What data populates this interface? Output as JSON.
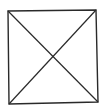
{
  "diagram": {
    "label": "Square with crossed diagonals",
    "stroke_color": "#2a2a2a",
    "background_color": "#ffffff",
    "shape": {
      "type": "square",
      "corners": {
        "top_left": [
          8,
          11
        ],
        "top_right": [
          96,
          10
        ],
        "bottom_right": [
          98,
          102
        ],
        "bottom_left": [
          9,
          104
        ]
      },
      "diagonals": [
        {
          "from": "top_left",
          "to": "bottom_right"
        },
        {
          "from": "top_right",
          "to": "bottom_left"
        }
      ],
      "intersection": [
        53,
        57
      ]
    }
  }
}
